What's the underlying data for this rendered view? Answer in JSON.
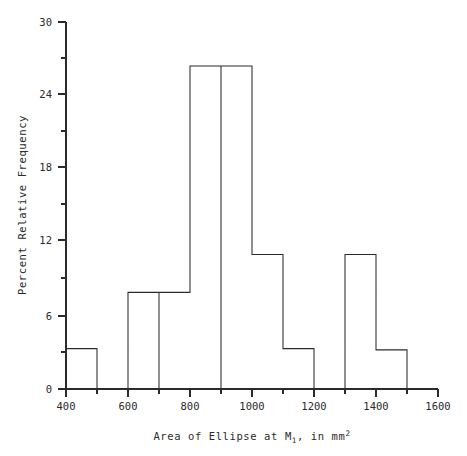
{
  "chart_data": {
    "type": "bar",
    "title": "",
    "subtitle": "",
    "xlabel": "Area of Ellipse at M1, in mm2",
    "xlabel_parts": {
      "lead": "Area of Ellipse at M",
      "sub": "1",
      "mid": ", in mm",
      "sup": "2"
    },
    "ylabel": "Percent Relative Frequency",
    "xlim": [
      400,
      1600
    ],
    "ylim": [
      0,
      30
    ],
    "grid": false,
    "legend": false,
    "bin_width": 100,
    "bin_edges": [
      400,
      500,
      600,
      700,
      800,
      900,
      1000,
      1100,
      1200,
      1300,
      1400,
      1500,
      1600
    ],
    "categories": [
      "400-500",
      "500-600",
      "600-700",
      "700-800",
      "800-900",
      "900-1000",
      "1000-1100",
      "1100-1200",
      "1200-1300",
      "1300-1400",
      "1400-1500",
      "1500-1600"
    ],
    "values": [
      3.3,
      0,
      7.9,
      7.9,
      26.4,
      26.4,
      11.0,
      3.3,
      0,
      11.0,
      3.2,
      0
    ],
    "x_ticks_major": [
      400,
      600,
      800,
      1000,
      1200,
      1400,
      1600
    ],
    "x_tick_labels": [
      "400",
      "600",
      "800",
      "1000",
      "1200",
      "1400",
      "1600"
    ],
    "x_ticks_minor": [
      500,
      700,
      900,
      1100,
      1300,
      1500
    ],
    "y_ticks_major": [
      0,
      6,
      12,
      18,
      24,
      30
    ],
    "y_tick_labels": [
      "0",
      "6",
      "12",
      "18",
      "24",
      "30"
    ],
    "y_ticks_minor": [
      3,
      9,
      15,
      21,
      27
    ],
    "colors": {
      "line": "#2b2b2b",
      "background": "#ffffff",
      "text": "#2b2b2b"
    }
  },
  "axes": {
    "y_title": "Percent Relative Frequency",
    "y_labels": {
      "t0": "0",
      "t6": "6",
      "t12": "12",
      "t18": "18",
      "t24": "24",
      "t30": "30"
    },
    "x_labels": {
      "t400": "400",
      "t600": "600",
      "t800": "800",
      "t1000": "1000",
      "t1200": "1200",
      "t1400": "1400",
      "t1600": "1600"
    },
    "x_title_lead": "Area of Ellipse at M",
    "x_title_sub": "1",
    "x_title_mid": ", in mm",
    "x_title_sup": "2"
  }
}
